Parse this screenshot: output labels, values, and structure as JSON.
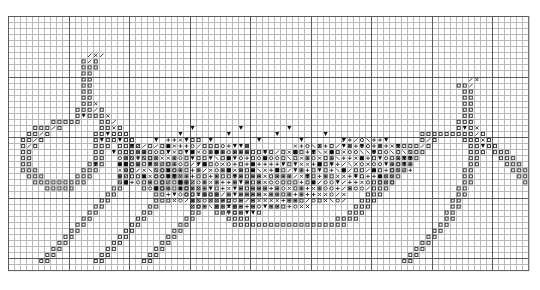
{
  "document": {
    "kind": "cross-stitch-pattern-chart",
    "title": "",
    "background_color": "#ffffff"
  },
  "chart_data": {
    "type": "heatmap",
    "title": "",
    "subtitle": "",
    "xlabel": "",
    "ylabel": "",
    "grid": true,
    "legend_position": "none",
    "cols": 86,
    "rows": 42,
    "cell_size_px": 6.05,
    "origin_px": [
      8,
      16
    ],
    "grid_line_color": "#b9b9b9",
    "bold_line_color": "#5a5a5a",
    "bold_every": 10,
    "symbol_color": "#3c3c3c",
    "symbol_fill_color": "#111111",
    "categories": [],
    "values": [],
    "symbol_key": {
      "0": "empty",
      "1": "open-square",
      "2": "x-cross",
      "3": "down-triangle-filled",
      "4": "filled-square",
      "5": "dotted-square",
      "6": "vertical-bar",
      "7": "diagonal-slash",
      "8": "open-circle",
      "9": "plus-cross",
      "A": "half-shaded-square",
      "B": "backslash",
      "C": "small-dot"
    },
    "cells": [
      "00000000000000000000000000000000000000000000000000000000000000000000000000000000000000",
      "00000000000000000000000000000000000000000000000000000000000000000000000000000000000000",
      "00000000000000000000000000000000000000000000000000000000000000000000000000000000000000",
      "00000000000000000000000000000000000000000000000000000000000000000000000000000000000000",
      "00000000000000000000000000000000000000000000000000000000000000000000000000000000000000",
      "00000000000000000000000000000000000000000000000000000000000000000000000000000000000000",
      "00000000000007270000000000000000000000000000000000000000000000000000000000000000000000",
      "00000000000017100000000000000000000000000000000000000000000000000000000000000000000000",
      "00000000000011100000000000000000000000000000000000000000000000000000000000000000000000",
      "00000000000011000000000000000000000000000000000000000000000000000000000000000000000000",
      "00000000000011000000000000000000000000000000000000000000000000000000000000007200000000",
      "00000000000011000000000000000000000000000000000000000000000000000000000000117000000000",
      "00000000000011000000000000000000000000000000000000000000000000000000000000011000000000",
      "00000000000011000000000000000000000000000000000000000000000000000000000000011000000000",
      "00000000000011200000000000000000000000000000000000000000000000000000000000011000000000",
      "00000000000111710000000000000000000000000000000000000000000000000000000000011000000000",
      "00000000000131112000000000000000000000000000000000000000000000000000000000011000000000",
      "00000001111100011700000000000000000000000000000000000000000000000000000000111000000000",
      "00001117100000011210000000000000000000000000000000000000000000000000000000131200000000",
      "00011710000000113111000000000000000000000000000000000000000000000000111111111710000000",
      "00117100000000131131100000000000000000000000000000000000000000000000171000011121000000",
      "00171000000000111011170000000000000000000000000000000000000000000001710000001131100000",
      "00110000000000110001121000000000000000000000000000000000000000000011100000001110111000",
      "00110000000000110001131110000000000000000000000000000000000000000111000000001100011100",
      "00110000000001110001110117100000000000000000000000000000000000001110000000001100001110",
      "00111000000011100001100011210000000000000000000000000000000000011100000000011000000111",
      "00011100000111000011000011311000000000000000000000000000000000111000000000011000000011",
      "00001111111110000011000001101170000000000000000000000000000001110000000000011000000001",
      "00000011111000000110000001100121000000000000000000000000000011100000000000110000000000",
      "00000000000000001100000011000113111000000000000000000000000111000000000000110000000000",
      "00000000000000011000000011000011011710000000000000000000001110000000000001100000000000",
      "00000000000000110000000110000011001121000000000000000000011100000000000001100000000000",
      "00000000000001100000001100000011000131100000000000000000111000000000000011000000000000",
      "00000000000011000000011000000110000011110000000000000011110000000000000011000000000000",
      "00000000000110000000110000001100000001111111111111111111000000000000000110000000000000",
      "00000000001100000001100000011000000000000000000000000000000000000000001100000000000000",
      "00000000011000000011000000110000000000000000000000000000000000000000011000000000000000",
      "00000000110000000110000001100000000000000000000000000000000000000000110000000000000000",
      "00000001100000001100000011000000000000000000000000000000000000000001100000000000000000",
      "00000011000000011000000110000000000000000000000000000000000000000011000000000000000000",
      "00000110000000110000001100000000000000000000000000000000000000000110000000000000000000",
      "00000000000000000000000000000000000000000000000000000000000000000000000000000000000000"
    ],
    "notes": "Cross-stitch style pattern chart: dense symbol band across the middle forming a valley, tall narrow column peaks on the left and right, light grid background with darker rule every 10 squares."
  },
  "symbols_overview": {
    "open_square": "□",
    "filled_square": "■",
    "down_triangle": "▼",
    "cross_x": "✕",
    "plus": "+",
    "circle": "○",
    "dotted": "░",
    "vertical_bar": "│",
    "slash": "/",
    "backslash": "\\"
  }
}
